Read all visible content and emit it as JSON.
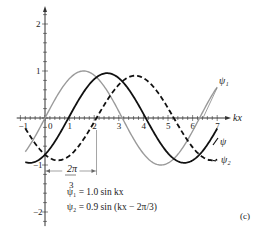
{
  "chart_data": {
    "type": "line",
    "title": "",
    "panel_label": "(c)",
    "xlabel": "kx",
    "ylabel": "",
    "xlim": [
      -1,
      7.4
    ],
    "ylim": [
      -2.3,
      2.3
    ],
    "x_ticks": [
      "-1",
      "0",
      "1",
      "2",
      "3",
      "4",
      "5",
      "6",
      "7"
    ],
    "y_ticks": [
      "2",
      "1",
      "-1",
      "-2"
    ],
    "series": [
      {
        "name": "ψ1",
        "label": "ψ₁",
        "amplitude": 1.0,
        "phase": 0,
        "style": "solid",
        "color": "#9a9a9a"
      },
      {
        "name": "ψ2",
        "label": "ψ₂",
        "amplitude": 0.9,
        "phase": -2.0944,
        "style": "dashed",
        "color": "#111111"
      },
      {
        "name": "ψ",
        "label": "ψ",
        "amplitude": 0.9539,
        "phase": -0.9539,
        "style": "solid",
        "color": "#111111"
      }
    ],
    "annotations": {
      "phase_shift_top": "2π",
      "phase_shift_bottom": "3",
      "phase_shift_value": 2.0944,
      "eq1": "ψ₁ = 1.0 sin kx",
      "eq2": "ψ₂ = 0.9 sin (kx − 2π/3)"
    }
  }
}
